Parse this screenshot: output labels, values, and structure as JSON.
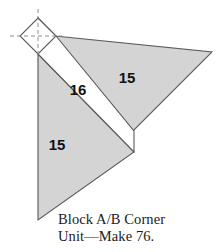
{
  "figure": {
    "caption": {
      "line1": "Block A/B Corner",
      "line2": "Unit—Make 76."
    },
    "colors": {
      "fabric_gray": "#d4d4d4",
      "fabric_white": "#ffffff",
      "outline": "#5a5a5a",
      "guide_dash": "#8c8c8c",
      "background": "#ffffff",
      "label_text": "#111111",
      "caption_text": "#1b1b1b"
    },
    "pieces": [
      {
        "id": "corner-square",
        "label": "",
        "shape": "on-point square",
        "fill": "#ffffff",
        "points": "38,18 56,36 38,54 20,36"
      },
      {
        "id": "strip-16",
        "label": "16",
        "shape": "parallelogram strip",
        "fill": "#ffffff",
        "points": "38,18 56,36 134,131 134,152",
        "label_x": 78,
        "label_y": 95
      },
      {
        "id": "triangle-15-upper-right",
        "label": "15",
        "shape": "right triangle",
        "fill": "#d4d4d4",
        "points": "55,36 212,52 133,131",
        "label_x": 127,
        "label_y": 83
      },
      {
        "id": "triangle-15-lower-left",
        "label": "15",
        "shape": "right triangle",
        "fill": "#d4d4d4",
        "points": "38,54 134,152 38,220",
        "label_x": 57,
        "label_y": 150
      }
    ],
    "guides": {
      "vertical_dash": {
        "x": 38,
        "y1": 9,
        "y2": 62
      },
      "horizontal_dash": {
        "y": 36,
        "x1": 10,
        "x2": 62
      }
    }
  }
}
